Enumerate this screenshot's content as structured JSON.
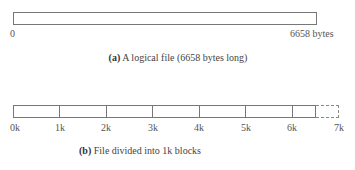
{
  "part_a": {
    "start_label": "0",
    "end_label": "6658 bytes",
    "caption_letter": "(a)",
    "caption_text": " A logical file (6658 bytes long)"
  },
  "part_b": {
    "caption_letter": "(b)",
    "caption_text": " File divided into 1k blocks",
    "ticks": [
      "0k",
      "1k",
      "2k",
      "3k",
      "4k",
      "5k",
      "6k",
      "7k"
    ],
    "file_size_bytes": 6658,
    "block_size": "1k"
  }
}
